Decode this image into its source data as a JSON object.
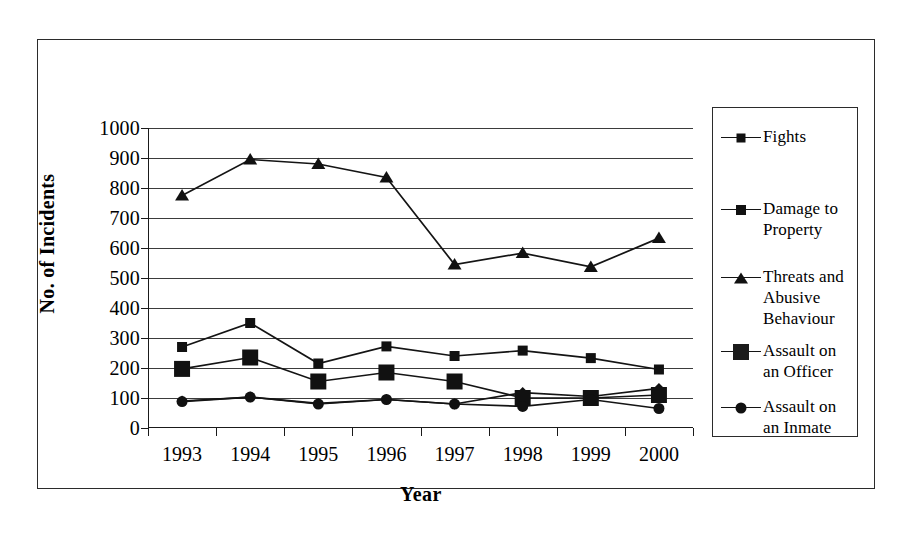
{
  "chart_data": {
    "type": "line",
    "title": "",
    "xlabel": "Year",
    "ylabel": "No. of Incidents",
    "categories": [
      "1993",
      "1994",
      "1995",
      "1996",
      "1997",
      "1998",
      "1999",
      "2000"
    ],
    "ylim": [
      0,
      1000
    ],
    "ytick_labels": [
      "1000",
      "900",
      "800",
      "700",
      "600",
      "500",
      "400",
      "300",
      "200",
      "100",
      "0"
    ],
    "ytick_values": [
      1000,
      900,
      800,
      700,
      600,
      500,
      400,
      300,
      200,
      100,
      0
    ],
    "grid": true,
    "legend_position": "right",
    "series": [
      {
        "name": "Fights",
        "marker": "diamond",
        "values": [
          90,
          103,
          82,
          95,
          80,
          118,
          105,
          132
        ]
      },
      {
        "name": "Damage to Property",
        "marker": "square",
        "values": [
          270,
          350,
          215,
          272,
          240,
          258,
          233,
          195
        ]
      },
      {
        "name": "Threats and Abusive Behaviour",
        "marker": "triangle",
        "values": [
          775,
          895,
          880,
          835,
          545,
          583,
          537,
          633
        ]
      },
      {
        "name": "Assault on an Officer",
        "marker": "big-square",
        "values": [
          197,
          235,
          155,
          185,
          155,
          100,
          100,
          110
        ]
      },
      {
        "name": "Assault on an Inmate",
        "marker": "circle",
        "values": [
          88,
          103,
          80,
          95,
          80,
          72,
          95,
          65
        ]
      }
    ]
  },
  "axes": {
    "y_title": "No. of Incidents",
    "x_title": "Year"
  },
  "legend": {
    "entries": [
      {
        "label": "Fights",
        "marker": "diamond"
      },
      {
        "label": "Damage to\nProperty",
        "marker": "square"
      },
      {
        "label": "Threats and\nAbusive\nBehaviour",
        "marker": "triangle"
      },
      {
        "label": "Assault on\nan Officer",
        "marker": "big-square"
      },
      {
        "label": "Assault on\nan Inmate",
        "marker": "circle"
      }
    ]
  },
  "colors": {
    "line": "#141414",
    "marker": "#111111",
    "grid": "#3b3b3b",
    "axis": "#1a1a1a",
    "frame": "#2b2b2b",
    "background": "#ffffff"
  }
}
